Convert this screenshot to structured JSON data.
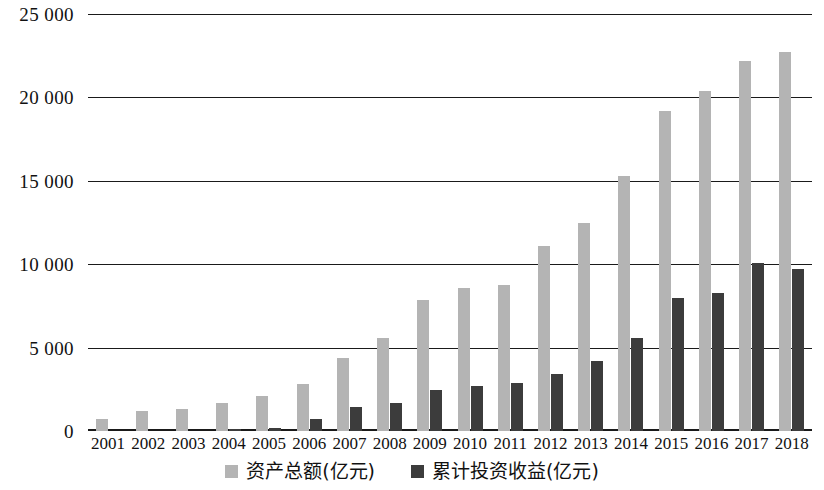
{
  "chart_data": {
    "type": "bar",
    "title": "",
    "subtitle": "",
    "xlabel": "",
    "ylabel": "",
    "ylim": [
      0,
      25000
    ],
    "y_ticks": [
      0,
      5000,
      10000,
      15000,
      20000,
      25000
    ],
    "y_tick_labels": [
      "0",
      "5 000",
      "10 000",
      "15 000",
      "20 000",
      "25 000"
    ],
    "grid": true,
    "legend_position": "bottom-center",
    "categories": [
      "2001",
      "2002",
      "2003",
      "2004",
      "2005",
      "2006",
      "2007",
      "2008",
      "2009",
      "2010",
      "2011",
      "2012",
      "2013",
      "2014",
      "2015",
      "2016",
      "2017",
      "2018"
    ],
    "series": [
      {
        "name": "资产总额(亿元)",
        "color": "#b4b4b4",
        "values": [
          720,
          1200,
          1320,
          1700,
          2100,
          2830,
          4400,
          5600,
          7850,
          8600,
          8750,
          11100,
          12500,
          15300,
          19200,
          20400,
          22200,
          22700
        ]
      },
      {
        "name": "累计投资收益(亿元)",
        "color": "#3c3c3c",
        "values": [
          0,
          0,
          0,
          120,
          180,
          700,
          1450,
          1650,
          2450,
          2700,
          2850,
          3400,
          4200,
          5550,
          7950,
          8250,
          10050,
          9700
        ]
      }
    ]
  },
  "legend": {
    "entries": [
      {
        "label": "资产总额(亿元)"
      },
      {
        "label": "累计投资收益(亿元)"
      }
    ]
  }
}
